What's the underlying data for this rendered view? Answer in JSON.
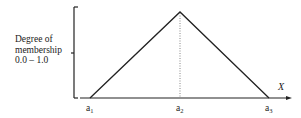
{
  "diagram": {
    "type": "triangular-membership-function",
    "y_axis": {
      "label_lines": [
        "Degree of",
        "membership",
        "0.0 – 1.0"
      ]
    },
    "x_axis": {
      "label": "X",
      "points": [
        {
          "id": "a1",
          "base": "a",
          "sub": "1"
        },
        {
          "id": "a2",
          "base": "a",
          "sub": "2"
        },
        {
          "id": "a3",
          "base": "a",
          "sub": "3"
        }
      ]
    },
    "colors": {
      "line": "#222222",
      "dotted": "#666666",
      "text": "#222222"
    }
  }
}
